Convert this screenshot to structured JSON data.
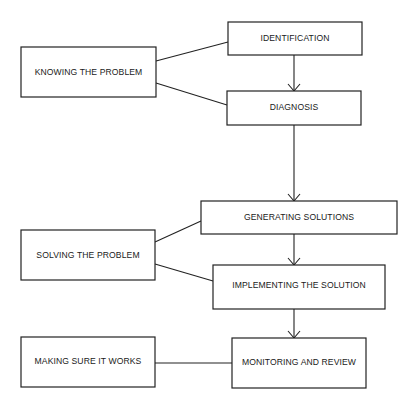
{
  "diagram": {
    "type": "flowchart",
    "stages": [
      {
        "id": "knowing",
        "label": "KNOWING THE PROBLEM"
      },
      {
        "id": "solving",
        "label": "SOLVING THE PROBLEM"
      },
      {
        "id": "making_sure",
        "label": "MAKING SURE IT WORKS"
      }
    ],
    "steps": [
      {
        "id": "identification",
        "label": "IDENTIFICATION",
        "stage": "knowing"
      },
      {
        "id": "diagnosis",
        "label": "DIAGNOSIS",
        "stage": "knowing"
      },
      {
        "id": "generating",
        "label": "GENERATING SOLUTIONS",
        "stage": "solving"
      },
      {
        "id": "implementing",
        "label": "IMPLEMENTING THE SOLUTION",
        "stage": "solving"
      },
      {
        "id": "monitoring",
        "label": "MONITORING AND REVIEW",
        "stage": "making_sure"
      }
    ],
    "arrows": [
      {
        "from": "identification",
        "to": "diagnosis"
      },
      {
        "from": "diagnosis",
        "to": "generating"
      },
      {
        "from": "generating",
        "to": "implementing"
      },
      {
        "from": "implementing",
        "to": "monitoring"
      }
    ],
    "links": [
      {
        "from": "knowing",
        "to": "identification"
      },
      {
        "from": "knowing",
        "to": "diagnosis"
      },
      {
        "from": "solving",
        "to": "generating"
      },
      {
        "from": "solving",
        "to": "implementing"
      },
      {
        "from": "making_sure",
        "to": "monitoring"
      }
    ]
  }
}
